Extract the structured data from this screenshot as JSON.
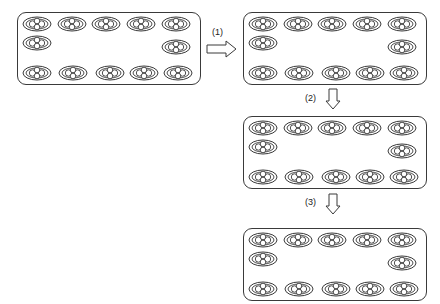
{
  "diagram": {
    "steps": [
      {
        "label": "(1)",
        "direction": "right"
      },
      {
        "label": "(2)",
        "direction": "down"
      },
      {
        "label": "(3)",
        "direction": "down"
      }
    ],
    "panels": [
      {
        "name": "initial",
        "rows": {
          "top": 5,
          "middle": 2,
          "bottom": 5
        }
      },
      {
        "name": "after-step-1",
        "rows": {
          "top": 5,
          "middle": 2,
          "bottom": 5
        }
      },
      {
        "name": "after-step-2",
        "rows": {
          "top": 5,
          "middle": 2,
          "bottom": 5
        }
      },
      {
        "name": "after-step-3",
        "rows": {
          "top": 5,
          "middle": 2,
          "bottom": 5
        }
      }
    ],
    "colors": {
      "stroke": "#3a3a3a",
      "background": "#ffffff"
    }
  }
}
